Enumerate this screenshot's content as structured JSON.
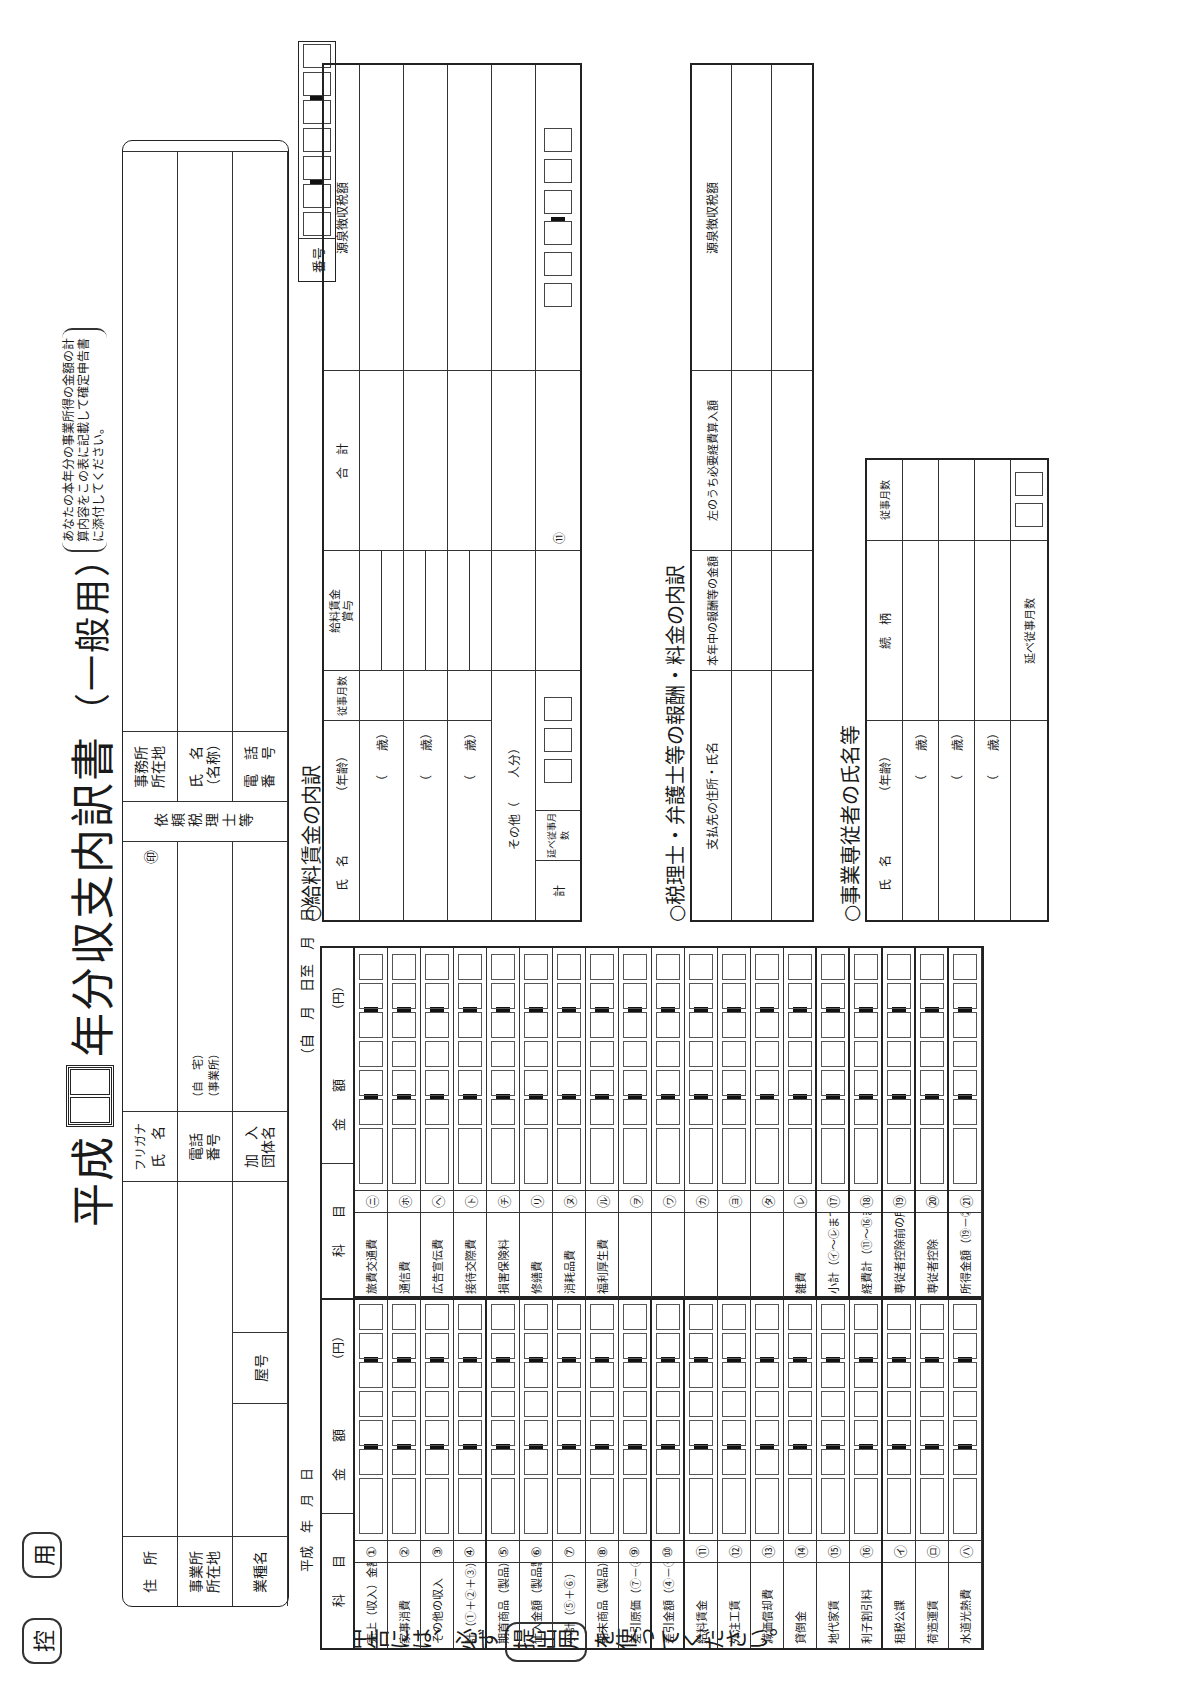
{
  "title": {
    "prefix": "平成",
    "main": "年分収支内訳書",
    "sub": "（一般用）"
  },
  "note": [
    "あなたの本年分の事業所得の金額の計",
    "算内容をこの表に記載して確定申告書",
    "に添付してください。"
  ],
  "control_mark": {
    "left": "控",
    "right": "用"
  },
  "side_note": {
    "before": "○申告には、必ず",
    "pill": "提出用",
    "after": "を使ってください。"
  },
  "header": {
    "address_label": "住　所",
    "office_label": "事業所\n所在地",
    "business_label": "業種名",
    "trade_name_label": "屋号",
    "name_kana": "フリガナ",
    "name_label": "氏　名",
    "seal": "㊞",
    "phone_label": "電話\n番号",
    "phone_home": "（自　宅）",
    "phone_office": "（事業所）",
    "group_label": "加　入\n団体名",
    "agent_label": "依頼税理士等",
    "agent_office_label": "事務所\n所在地",
    "agent_name_label": "氏　名\n（名称）",
    "agent_phone_label": "電　話\n番　号"
  },
  "number_box": {
    "label": "番号"
  },
  "date_line": "平成　年　月　日",
  "period": "（自　月　日至　月　日）",
  "income_table": {
    "headers": {
      "item": "科　　目",
      "amount": "金　　額",
      "unit": "（円）"
    },
    "groups": {
      "revenue": "収入金額",
      "cost": "売上原価",
      "expenses": "経費",
      "other_exp": "その他の経費"
    },
    "rows": [
      {
        "no": "①",
        "label": "売上（収入）金額"
      },
      {
        "no": "②",
        "label": "家事消費"
      },
      {
        "no": "③",
        "label": "その他の収入"
      },
      {
        "no": "④",
        "label": "計（①＋②＋③）"
      },
      {
        "no": "⑤",
        "label": "期首商品（製品）棚卸高"
      },
      {
        "no": "⑥",
        "label": "仕入金額（製品製造原価）"
      },
      {
        "no": "⑦",
        "label": "小計（⑤＋⑥）"
      },
      {
        "no": "⑧",
        "label": "期末商品（製品）棚卸高"
      },
      {
        "no": "⑨",
        "label": "差引原価（⑦－⑧）"
      },
      {
        "no": "⑩",
        "label": "差引金額（④－⑨）"
      },
      {
        "no": "⑪",
        "label": "給料賃金"
      },
      {
        "no": "⑫",
        "label": "外注工賃"
      },
      {
        "no": "⑬",
        "label": "減価償却費"
      },
      {
        "no": "⑭",
        "label": "貸倒金"
      },
      {
        "no": "⑮",
        "label": "地代家賃"
      },
      {
        "no": "⑯",
        "label": "利子割引料"
      },
      {
        "no": "㋑",
        "label": "租税公課"
      },
      {
        "no": "㋺",
        "label": "荷造運賃"
      },
      {
        "no": "㋩",
        "label": "水道光熱費"
      }
    ]
  },
  "expense_table": {
    "headers": {
      "item": "科　　目",
      "amount": "金　　額",
      "unit": "（円）"
    },
    "group_label": "その他の経費",
    "rows": [
      {
        "no": "㋥",
        "label": "旅費交通費"
      },
      {
        "no": "㋭",
        "label": "通信費"
      },
      {
        "no": "㋬",
        "label": "広告宣伝費"
      },
      {
        "no": "㋣",
        "label": "接待交際費"
      },
      {
        "no": "㋠",
        "label": "損害保険料"
      },
      {
        "no": "㋷",
        "label": "修繕費"
      },
      {
        "no": "㋦",
        "label": "消耗品費"
      },
      {
        "no": "㋸",
        "label": "福利厚生費"
      },
      {
        "no": "㋾",
        "label": ""
      },
      {
        "no": "㋻",
        "label": ""
      },
      {
        "no": "㋕",
        "label": ""
      },
      {
        "no": "㋵",
        "label": ""
      },
      {
        "no": "㋟",
        "label": ""
      },
      {
        "no": "㋹",
        "label": "雑費"
      },
      {
        "no": "⑰",
        "label": "小計（㋑～㋹までの計）"
      },
      {
        "no": "⑱",
        "label": "経費計（⑪～⑯までの計＋⑰）"
      },
      {
        "no": "⑲",
        "label": "専従者控除前の所得金額（⑩－⑱）"
      },
      {
        "no": "⑳",
        "label": "専従者控除"
      },
      {
        "no": "㉑",
        "label": "所得金額（⑲－⑳）"
      }
    ]
  },
  "salary_section": {
    "title": "○給料賃金の内訳",
    "headers": {
      "name": "氏　名",
      "age": "（年齢）",
      "months": "従事月数",
      "wage": "給料賃金",
      "bonus": "賞与",
      "total": "合　計",
      "withholding": "源泉徴収税額",
      "yen": "円",
      "month_unit": "月"
    },
    "rows": [
      {
        "age": "（　　歳）"
      },
      {
        "age": "（　　歳）"
      },
      {
        "age": "（　　歳）"
      }
    ],
    "other_label": "その他（　　人分）",
    "total_label": "計",
    "months_total_label": "延べ従事月数",
    "total_no": "⑪"
  },
  "fee_section": {
    "title": "○税理士・弁護士等の報酬・料金の内訳",
    "headers": {
      "payee": "支払先の住所・氏名",
      "amount": "本年中の報酬等の金額",
      "necessary": "左のうち必要経費算入額",
      "withholding": "源泉徴収税額",
      "yen": "円"
    }
  },
  "family_section": {
    "title": "○事業専従者の氏名等",
    "headers": {
      "name": "氏　名",
      "age": "（年齢）",
      "relation": "続　柄",
      "months": "従事月数",
      "month_unit": "月"
    },
    "rows": [
      {
        "age": "（　　歳）"
      },
      {
        "age": "（　　歳）"
      },
      {
        "age": "（　　歳）"
      }
    ],
    "months_total_label": "延べ従事月数"
  }
}
